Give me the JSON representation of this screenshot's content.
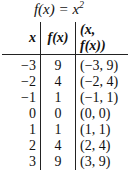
{
  "title": {
    "func": "f(x) = x",
    "exp": "2"
  },
  "headers": [
    "x",
    "f(x)",
    "(x, f(x))"
  ],
  "rows": [
    {
      "x": "−3",
      "fx": "9",
      "pair": "(−3, 9)"
    },
    {
      "x": "−2",
      "fx": "4",
      "pair": "(−2, 4)"
    },
    {
      "x": "−1",
      "fx": "1",
      "pair": "(−1, 1)"
    },
    {
      "x": "0",
      "fx": "0",
      "pair": "(0, 0)"
    },
    {
      "x": "1",
      "fx": "1",
      "pair": "(1, 1)"
    },
    {
      "x": "2",
      "fx": "4",
      "pair": "(2, 4)"
    },
    {
      "x": "3",
      "fx": "9",
      "pair": "(3, 9)"
    }
  ]
}
